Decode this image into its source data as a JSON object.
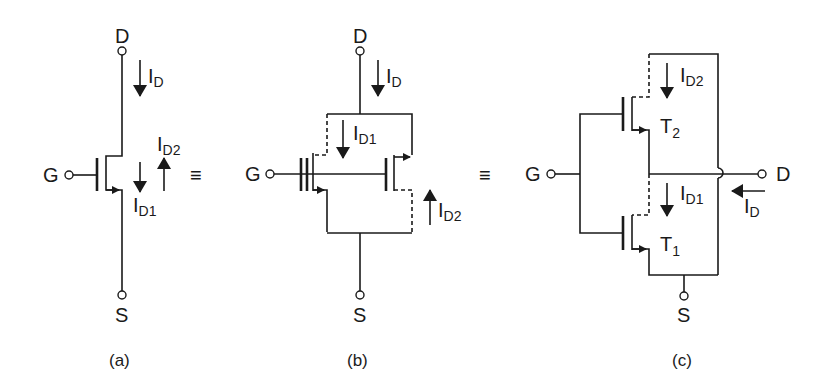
{
  "figure": {
    "equivalence_symbol": "≡",
    "panels": [
      {
        "id": "a",
        "caption": "(a)",
        "terminals": {
          "drain": "D",
          "gate": "G",
          "source": "S"
        },
        "currents": [
          {
            "name": "I",
            "sub": "D",
            "direction": "down"
          },
          {
            "name": "I",
            "sub": "D1",
            "direction": "down"
          },
          {
            "name": "I",
            "sub": "D2",
            "direction": "up"
          }
        ]
      },
      {
        "id": "b",
        "caption": "(b)",
        "terminals": {
          "drain": "D",
          "gate": "G",
          "source": "S"
        },
        "currents": [
          {
            "name": "I",
            "sub": "D",
            "direction": "down"
          },
          {
            "name": "I",
            "sub": "D1",
            "direction": "down"
          },
          {
            "name": "I",
            "sub": "D2",
            "direction": "up"
          }
        ]
      },
      {
        "id": "c",
        "caption": "(c)",
        "terminals": {
          "drain": "D",
          "gate": "G",
          "source": "S"
        },
        "transistors": [
          {
            "name": "T",
            "sub": "2"
          },
          {
            "name": "T",
            "sub": "1"
          }
        ],
        "currents": [
          {
            "name": "I",
            "sub": "D2",
            "direction": "down"
          },
          {
            "name": "I",
            "sub": "D1",
            "direction": "down"
          },
          {
            "name": "I",
            "sub": "D",
            "direction": "left"
          }
        ]
      }
    ]
  }
}
